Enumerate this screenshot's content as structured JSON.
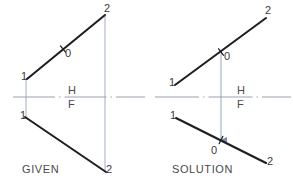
{
  "figure": {
    "background_color": "#ffffff",
    "object_line_color": "#1f1f1f",
    "projection_line_color": "#8d9cb8",
    "reference_line_color": "#9aa3b2",
    "text_color": "#3a3a3a"
  },
  "panels": [
    {
      "id": "given",
      "caption": "GIVEN",
      "caption_position": {
        "x": 22,
        "y": 164
      },
      "reference_line": {
        "label_top": "H",
        "label_bottom": "F",
        "label_top_position": {
          "x": 68,
          "y": 85
        },
        "label_bottom_position": {
          "x": 68,
          "y": 99
        },
        "x1": 13,
        "y1": 97,
        "x2": 145,
        "y2": 97,
        "style": "dash-dot"
      },
      "lines": [
        {
          "name": "top-view-line",
          "view": "H",
          "x1": 27,
          "y1": 79,
          "x2": 105,
          "y2": 15,
          "endpoints": [
            {
              "label": "1",
              "x": 27,
              "y": 79,
              "label_position": {
                "x": 21,
                "y": 71
              }
            },
            {
              "label": "2",
              "x": 105,
              "y": 15,
              "label_position": {
                "x": 104,
                "y": 3
              }
            }
          ],
          "marked_point": {
            "label": "0",
            "x": 63,
            "y": 49,
            "label_position": {
              "x": 65,
              "y": 48
            },
            "marker": "tick-cross"
          }
        },
        {
          "name": "front-view-line",
          "view": "F",
          "x1": 25,
          "y1": 117,
          "x2": 106,
          "y2": 172,
          "endpoints": [
            {
              "label": "1",
              "x": 25,
              "y": 117,
              "label_position": {
                "x": 20,
                "y": 110
              }
            },
            {
              "label": "2",
              "x": 106,
              "y": 172,
              "label_position": {
                "x": 106,
                "y": 164
              }
            }
          ],
          "marked_point": null
        }
      ],
      "projectors": [
        {
          "name": "projector-point-1",
          "x1": 26,
          "y1": 78,
          "x2": 26,
          "y2": 119,
          "arrow": false
        },
        {
          "name": "projector-point-2",
          "x1": 105,
          "y1": 16,
          "x2": 105,
          "y2": 172,
          "arrow": false
        }
      ]
    },
    {
      "id": "solution",
      "caption": "SOLUTION",
      "caption_position": {
        "x": 172,
        "y": 164
      },
      "reference_line": {
        "label_top": "H",
        "label_bottom": "F",
        "label_top_position": {
          "x": 237,
          "y": 85
        },
        "label_bottom_position": {
          "x": 237,
          "y": 99
        },
        "x1": 155,
        "y1": 97,
        "x2": 291,
        "y2": 97,
        "style": "dash-dot"
      },
      "lines": [
        {
          "name": "top-view-line",
          "view": "H",
          "x1": 175,
          "y1": 85,
          "x2": 266,
          "y2": 18,
          "endpoints": [
            {
              "label": "1",
              "x": 175,
              "y": 85,
              "label_position": {
                "x": 169,
                "y": 77
              }
            },
            {
              "label": "2",
              "x": 266,
              "y": 18,
              "label_position": {
                "x": 265,
                "y": 5
              }
            }
          ],
          "marked_point": {
            "label": "0",
            "x": 221,
            "y": 52,
            "label_position": {
              "x": 224,
              "y": 51
            },
            "marker": "tick-cross"
          }
        },
        {
          "name": "front-view-line",
          "view": "F",
          "x1": 176,
          "y1": 118,
          "x2": 266,
          "y2": 163,
          "endpoints": [
            {
              "label": "1",
              "x": 176,
              "y": 118,
              "label_position": {
                "x": 170,
                "y": 110
              }
            },
            {
              "label": "2",
              "x": 266,
              "y": 163,
              "label_position": {
                "x": 267,
                "y": 156
              }
            }
          ],
          "marked_point": {
            "label": "0",
            "x": 221,
            "y": 140,
            "label_position": {
              "x": 211,
              "y": 145
            },
            "marker": "tick-cross"
          }
        }
      ],
      "projectors": [
        {
          "name": "projector-point-0",
          "x1": 221,
          "y1": 53,
          "x2": 221,
          "y2": 140,
          "arrow": true
        }
      ]
    }
  ]
}
